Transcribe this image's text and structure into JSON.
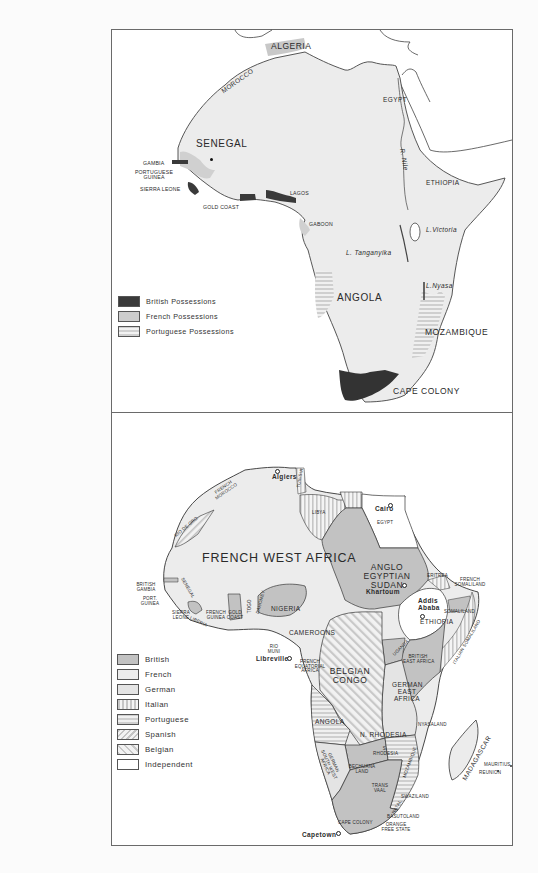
{
  "map1": {
    "title_region": "Africa — European possessions (c. 1880)",
    "labels": {
      "algeria": "ALGERIA",
      "morocco": "MOROCCO",
      "egypt": "EGYPT",
      "nile": "R. Nile",
      "senegal": "SENEGAL",
      "gambia": "GAMBIA",
      "portuguese_guinea_1": "PORTUGUESE",
      "portuguese_guinea_2": "GUINEA",
      "sierra_leone": "SIERRA LEONE",
      "gold_coast": "GOLD COAST",
      "lagos": "LAGOS",
      "gaboon": "GABOON",
      "ethiopia": "ETHIOPIA",
      "lake_victoria": "L.Victoria",
      "lake_tanganyika": "L. Tanganyika",
      "lake_nyasa": "L.Nyasa",
      "angola": "ANGOLA",
      "mozambique": "MOZAMBIQUE",
      "cape_colony": "CAPE COLONY"
    },
    "legend": [
      {
        "label": "British Possessions",
        "pattern": "dark"
      },
      {
        "label": "French Possessions",
        "pattern": "gray"
      },
      {
        "label": "Portuguese Possessions",
        "pattern": "hstripe"
      }
    ]
  },
  "map2": {
    "title_region": "Africa — Partition (c. 1914)",
    "labels": {
      "algiers": "Algiers",
      "tunisia": "TUNISIA",
      "french_morocco_1": "FRENCH",
      "french_morocco_2": "MOROCCO",
      "rio_de_oro": "RIO DE ORO",
      "libya": "LIBYA",
      "cairo": "Cairo",
      "egypt": "EGYPT",
      "french_west_africa": "FRENCH WEST AFRICA",
      "sudan_1": "ANGLO",
      "sudan_2": "EGYPTIAN",
      "sudan_3": "SUDAN",
      "khartoum": "Khartoum",
      "eritrea": "ERITREA",
      "french_somaliland_1": "FRENCH",
      "french_somaliland_2": "SOMALILAND",
      "addis_1": "Addis",
      "addis_2": "Ababa",
      "ethiopia": "ETHIOPIA",
      "somaliland": "SOMALILAND",
      "italian_somaliland": "ITALIAN SOMALILAND",
      "british_gambia_1": "BRITISH",
      "british_gambia_2": "GAMBIA",
      "port_guinea_1": "PORT.",
      "port_guinea_2": "GUINEA",
      "senegal": "SENEGAL",
      "sierra_leone_1": "SIERRA",
      "sierra_leone_2": "LEONE",
      "liberia": "LIBERIA",
      "french_guinea_1": "FRENCH",
      "french_guinea_2": "GUINEA",
      "gold_coast_1": "GOLD",
      "gold_coast_2": "COAST",
      "togo": "TOGO",
      "dahomey": "DAHOMEY",
      "nigeria": "NIGERIA",
      "cameroons": "CAMEROONS",
      "rio_muni_1": "RIO",
      "rio_muni_2": "MUNI",
      "libreville": "Libreville",
      "fea_1": "FRENCH",
      "fea_2": "EQUATORIAL",
      "fea_3": "AFRICA",
      "belgian_congo_1": "BELGIAN",
      "belgian_congo_2": "CONGO",
      "uganda": "UGANDA",
      "british_east_africa_1": "BRITISH",
      "british_east_africa_2": "EAST AFRICA",
      "german_east_africa_1": "GERMAN",
      "german_east_africa_2": "EAST",
      "german_east_africa_3": "AFRICA",
      "angola": "ANGOLA",
      "n_rhodesia": "N. RHODESIA",
      "nyasaland": "NYASALAND",
      "s_rhodesia_1": "S.",
      "s_rhodesia_2": "RHODESIA",
      "mozambique": "MOZAMBIQUE",
      "gswa_1": "GERMAN",
      "gswa_2": "SOUTH WEST",
      "gswa_3": "AFRICA",
      "bechuanaland_1": "BECHUANA",
      "bechuanaland_2": "LAND",
      "transvaal_1": "TRANS",
      "transvaal_2": "VAAL",
      "natal": "NATAL",
      "swaziland": "SWAZILAND",
      "basutoland": "BASUTOLAND",
      "orange_1": "ORANGE",
      "orange_2": "FREE STATE",
      "cape_colony": "CAPE COLONY",
      "capetown": "Capetown",
      "madagascar": "MADAGASCAR",
      "mauritius": "MAURITIUS",
      "reunion": "REUNION"
    },
    "legend": [
      {
        "label": "British",
        "pattern": "british"
      },
      {
        "label": "French",
        "pattern": "french"
      },
      {
        "label": "German",
        "pattern": "german"
      },
      {
        "label": "Italian",
        "pattern": "vstripe"
      },
      {
        "label": "Portuguese",
        "pattern": "hstripe"
      },
      {
        "label": "Spanish",
        "pattern": "dstripe"
      },
      {
        "label": "Belgian",
        "pattern": "dstripe2"
      },
      {
        "label": "Independent",
        "pattern": "white"
      }
    ]
  },
  "colors": {
    "land": "#ececec",
    "british_dark": "#3a3a3a",
    "british_gray": "#c2c2c2",
    "french_gray": "#d4d4d4",
    "border": "#6a6a6a"
  }
}
